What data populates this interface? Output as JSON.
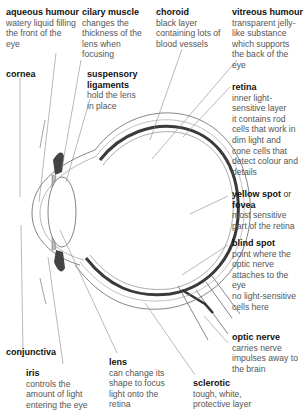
{
  "labels": {
    "aqueous_humour": {
      "title": "aqueous humour",
      "desc": "watery liquid filling\nthe front of the\neye"
    },
    "ciliary_muscle": {
      "title": "cilary muscle",
      "desc": "changes the\nthickness of the\nlens when\nfocusing"
    },
    "choroid": {
      "title": "choroid",
      "desc": "black layer\ncontaining lots of\nblood vessels"
    },
    "vitreous_humour": {
      "title": "vitreous humour",
      "desc": "transparent jelly-\nlike substance\nwhich supports\nthe back of the\neye"
    },
    "cornea": {
      "title": "cornea"
    },
    "suspensory_ligaments": {
      "title": "suspensory\nligaments",
      "desc": "hold the lens\nin place"
    },
    "retina": {
      "title": "retina",
      "desc": "inner light-\nsensitive layer\nit contains rod\ncells that work in\ndim light and\ncone cells that\ndetect colour and\ndetails"
    },
    "yellow_spot": {
      "title": "yellow spot",
      "or": " or",
      "title2": "fovea",
      "desc": "most sensitive\npart of the retina"
    },
    "blind_spot": {
      "title": "blind spot",
      "desc": "point where the\noptic nerve\nattaches to the\neye\nno light-sensitive\ncells here"
    },
    "optic_nerve": {
      "title": "optic nerve",
      "desc": "carries nerve\nimpulses away to\nthe brain"
    },
    "conjunctiva": {
      "title": "conjunctiva"
    },
    "iris": {
      "title": "iris",
      "desc": "controls the\namount of light\nentering the eye"
    },
    "lens": {
      "title": "lens",
      "desc": "can change its\nshape to focus\nlight onto the\nretina"
    },
    "sclerotic": {
      "title": "sclerotic",
      "desc": "tough, white,\nprotective layer"
    }
  },
  "colors": {
    "choroid": "#3a3a3a",
    "sclera_fill": "#efefef",
    "leader": "#8a8a8a",
    "outline": "#666666"
  }
}
